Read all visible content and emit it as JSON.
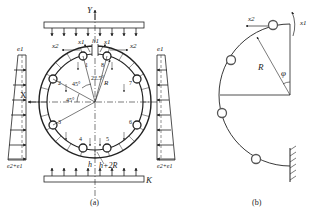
{
  "figure_a": {
    "caption": "(a)",
    "axis_y": "Y",
    "axis_x": "X",
    "top_load_label": "",
    "bottom_load_label": "K",
    "left_load_top": "e1",
    "left_load_bottom": "e2+e1",
    "right_load_top": "e1",
    "right_load_bottom": "e2+e1",
    "gap_label": "h1",
    "x1_left": "x1",
    "x1_right": "x1",
    "x2_left": "x2",
    "x2_right": "x2",
    "angle_45_upper": "45°",
    "angle_45_lower": "45°",
    "angle_22_5": "22.5°",
    "radius_label": "R",
    "bottom_h": "h",
    "bottom_h_2r": "h+2R",
    "node_numbers": [
      "1",
      "2",
      "3",
      "4",
      "5",
      "6",
      "7",
      "8"
    ]
  },
  "figure_b": {
    "caption": "(b)",
    "x1_label": "x1",
    "x2_label": "x2",
    "radius_label": "R",
    "angle_label": "φ"
  }
}
